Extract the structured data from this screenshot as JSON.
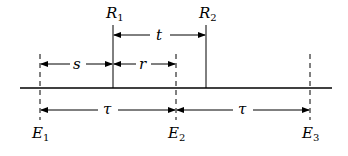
{
  "diagram": {
    "colors": {
      "ink": "#000000",
      "background": "#ffffff"
    },
    "timeline": {
      "y": 88,
      "x_start": 20,
      "x_end": 332
    },
    "events": [
      {
        "id": "E1",
        "base": "E",
        "sub": "1",
        "x": 40
      },
      {
        "id": "E2",
        "base": "E",
        "sub": "2",
        "x": 176
      },
      {
        "id": "E3",
        "base": "E",
        "sub": "3",
        "x": 310
      }
    ],
    "receptions": [
      {
        "id": "R1",
        "base": "R",
        "sub": "1",
        "x": 113
      },
      {
        "id": "R2",
        "base": "R",
        "sub": "2",
        "x": 206
      }
    ],
    "intervals": {
      "t": {
        "label": "t",
        "from": "R1",
        "to": "R2"
      },
      "s": {
        "label": "s",
        "from": "E1",
        "to": "R1"
      },
      "r": {
        "label": "r",
        "from": "R1",
        "to": "E2"
      },
      "tau1": {
        "label": "τ",
        "from": "E1",
        "to": "E2"
      },
      "tau2": {
        "label": "τ",
        "from": "E2",
        "to": "E3"
      }
    }
  }
}
